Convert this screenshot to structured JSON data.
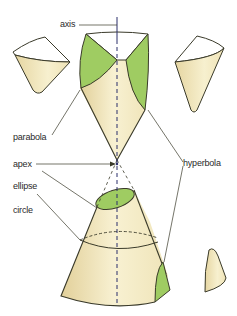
{
  "labels": {
    "axis": "axis",
    "parabola": "parabola",
    "apex": "apex",
    "ellipse": "ellipse",
    "circle": "circle",
    "hyperbola": "hyperbola"
  },
  "colors": {
    "cone_fill": "#f3ebc4",
    "cone_shade": "#e4d49c",
    "section_green": "#9fcc62",
    "outline": "#3a3a2a",
    "axis_line": "#2b2f6b",
    "label_text": "#2a2a2a"
  }
}
